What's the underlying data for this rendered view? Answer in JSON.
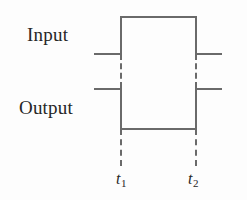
{
  "figure": {
    "type": "timing-diagram",
    "background_color": "#fdfdfd",
    "line_color": "#6a6a6a",
    "text_color": "#262626",
    "width": 247,
    "height": 200
  },
  "labels": {
    "input": "Input",
    "output": "Output"
  },
  "time_markers": [
    {
      "name": "t1",
      "symbol": "t",
      "subscript": "1",
      "x": 120
    },
    {
      "name": "t2",
      "symbol": "t",
      "subscript": "2",
      "x": 195
    }
  ],
  "chart_data": {
    "type": "line",
    "title": "",
    "xlabel": "",
    "ylabel": "",
    "legend": [
      "Input",
      "Output"
    ],
    "x_ticks": [
      "t₁",
      "t₂"
    ],
    "x_tick_values": [
      120,
      195
    ],
    "grid": false,
    "series": [
      {
        "name": "Input",
        "description": "Low before t1, high between t1 and t2, low after t2",
        "levels": [
          "low",
          "high",
          "low"
        ],
        "transitions": [
          {
            "at": "t1",
            "edge": "rising"
          },
          {
            "at": "t2",
            "edge": "falling"
          }
        ],
        "points": [
          {
            "x": 94,
            "y": 53
          },
          {
            "x": 120,
            "y": 53
          },
          {
            "x": 120,
            "y": 17
          },
          {
            "x": 195,
            "y": 17
          },
          {
            "x": 195,
            "y": 53
          },
          {
            "x": 222,
            "y": 53
          }
        ]
      },
      {
        "name": "Output",
        "description": "High before t1, low between t1 and t2, high after t2",
        "levels": [
          "high",
          "low",
          "high"
        ],
        "transitions": [
          {
            "at": "t1",
            "edge": "falling"
          },
          {
            "at": "t2",
            "edge": "rising"
          }
        ],
        "points": [
          {
            "x": 94,
            "y": 88
          },
          {
            "x": 120,
            "y": 88
          },
          {
            "x": 120,
            "y": 128
          },
          {
            "x": 195,
            "y": 128
          },
          {
            "x": 195,
            "y": 88
          },
          {
            "x": 222,
            "y": 88
          }
        ]
      }
    ],
    "annotations": [
      {
        "text": "Input",
        "x": 27,
        "y": 25
      },
      {
        "text": "Output",
        "x": 19,
        "y": 98
      }
    ]
  }
}
